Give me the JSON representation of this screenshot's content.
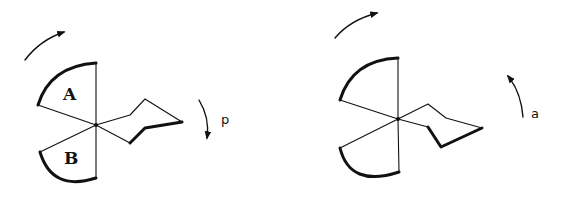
{
  "figure": {
    "left": {
      "sector_labels": {
        "upper": "A",
        "lower": "B"
      },
      "rotation_label": "p",
      "rotation_direction": "clockwise"
    },
    "right": {
      "rotation_label": "a",
      "rotation_direction": "counterclockwise"
    }
  },
  "colors": {
    "stroke": "#111111",
    "background": "#ffffff"
  }
}
